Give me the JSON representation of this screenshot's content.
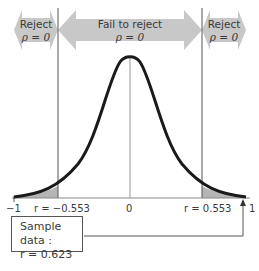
{
  "diagram": {
    "type": "hypothesis-test-correlation",
    "regions": [
      {
        "label": "Reject",
        "hypothesis": "ρ = 0"
      },
      {
        "label": "Fail to reject",
        "hypothesis": "ρ = 0"
      },
      {
        "label": "Reject",
        "hypothesis": "ρ = 0"
      }
    ],
    "axis": {
      "ticks": [
        {
          "label": "−1"
        },
        {
          "label": "r = −0.553"
        },
        {
          "label": "0"
        },
        {
          "label": "r = 0.553"
        },
        {
          "label": "1"
        }
      ]
    },
    "critical_values": [
      -0.553,
      0.553
    ],
    "sample_box": {
      "line1": "Sample data :",
      "line2": "r = 0.623"
    },
    "colors": {
      "arrow_fill": "#c8c8c8",
      "tail_fill": "#b5b5b5",
      "curve": "#1a1a1a",
      "lines": "#555555"
    }
  }
}
